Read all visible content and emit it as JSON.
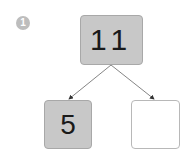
{
  "step_badge": "1",
  "number_bond": {
    "whole": "11",
    "parts": [
      {
        "value": "5",
        "filled": true
      },
      {
        "value": "",
        "filled": false
      }
    ]
  },
  "colors": {
    "box_fill": "#c8c8c8",
    "badge": "#bdbdbd",
    "arrow": "#555555"
  }
}
